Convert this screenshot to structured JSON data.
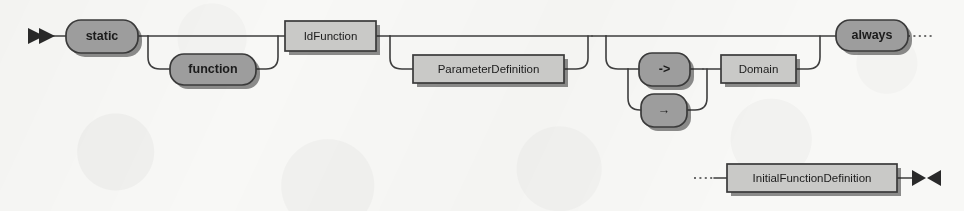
{
  "diagram": {
    "kind": "railroad-syntax-diagram",
    "name": "FunctionDeclaration",
    "width": 964,
    "height": 211,
    "colors": {
      "background": "#f8f8f6",
      "rail": "#3e3e3e",
      "terminal_fill": "#9d9d9d",
      "nonterminal_fill": "#c9c9c7",
      "node_stroke": "#3a3a3a",
      "label_text": "#1b1b1b",
      "shadow": "#1e1e1e"
    },
    "markers": {
      "start": "►►",
      "start_name": "double-right-triangle-start-marker",
      "end": "►◄",
      "end_name": "bowtie-end-marker",
      "continuation": "dotted-leader"
    },
    "rows": [
      {
        "id": "row-1",
        "baseline_y": 36,
        "continues": true
      },
      {
        "id": "row-2",
        "baseline_y": 178,
        "continues": false
      }
    ],
    "nodes": [
      {
        "id": "static",
        "label": "static",
        "type": "terminal",
        "shape": "rounded",
        "x": 66,
        "y": 20,
        "w": 72,
        "h": 33,
        "row": "row-1",
        "optional": false
      },
      {
        "id": "function",
        "label": "function",
        "type": "terminal",
        "shape": "rounded",
        "x": 170,
        "y": 54,
        "w": 86,
        "h": 31,
        "row": "row-1",
        "optional": true
      },
      {
        "id": "idfunction",
        "label": "IdFunction",
        "type": "nonterminal",
        "shape": "rectangle",
        "x": 285,
        "y": 21,
        "w": 91,
        "h": 30,
        "row": "row-1",
        "optional": false
      },
      {
        "id": "parameterdefinition",
        "label": "ParameterDefinition",
        "type": "nonterminal",
        "shape": "rectangle",
        "x": 413,
        "y": 55,
        "w": 151,
        "h": 28,
        "row": "row-1",
        "optional": true
      },
      {
        "id": "arrow-ascii",
        "label": "->",
        "type": "terminal",
        "shape": "rounded",
        "x": 639,
        "y": 53,
        "w": 51,
        "h": 33,
        "row": "row-1",
        "optional": false,
        "choice_group": "arrow-choice"
      },
      {
        "id": "arrow-unicode",
        "label": "→",
        "type": "terminal",
        "shape": "rounded",
        "x": 641,
        "y": 94,
        "w": 46,
        "h": 33,
        "row": "row-1",
        "optional": false,
        "choice_group": "arrow-choice"
      },
      {
        "id": "domain",
        "label": "Domain",
        "type": "nonterminal",
        "shape": "rectangle",
        "x": 721,
        "y": 55,
        "w": 75,
        "h": 28,
        "row": "row-1",
        "optional": false
      },
      {
        "id": "always",
        "label": "always",
        "type": "terminal",
        "shape": "rounded",
        "x": 836,
        "y": 20,
        "w": 72,
        "h": 31,
        "row": "row-1",
        "optional": false
      },
      {
        "id": "initialfunctiondefinition",
        "label": "InitialFunctionDefinition",
        "type": "nonterminal",
        "shape": "rectangle",
        "x": 727,
        "y": 164,
        "w": 170,
        "h": 28,
        "row": "row-2",
        "optional": false
      }
    ],
    "branch_groups": [
      {
        "id": "static-function-alt",
        "label": "static-or-function-alternation",
        "members": [
          "static",
          "function"
        ]
      },
      {
        "id": "parameterdefinition-opt",
        "label": "optional-parameter-definition",
        "members": [
          "parameterdefinition"
        ]
      },
      {
        "id": "arrow-choice",
        "label": "arrow-operator-choice",
        "members": [
          "arrow-ascii",
          "arrow-unicode"
        ]
      },
      {
        "id": "domain-opt",
        "label": "optional-arrow-domain-clause",
        "members": [
          "arrow-ascii",
          "arrow-unicode",
          "domain"
        ]
      }
    ]
  }
}
